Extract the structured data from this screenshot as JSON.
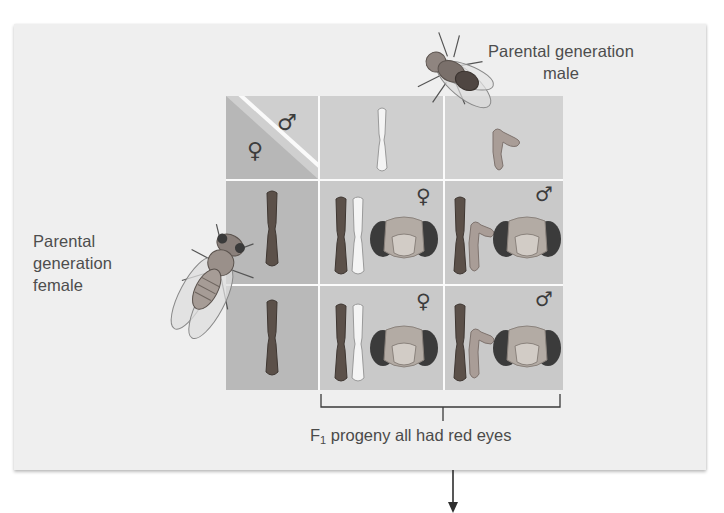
{
  "labels": {
    "parental_female_lines": [
      "Parental",
      "generation",
      "female"
    ],
    "parental_male_lines": [
      "Parental generation",
      "male"
    ],
    "caption_prefix": "F",
    "caption_subscript": "1",
    "caption_text": " progeny all had red eyes"
  },
  "symbols": {
    "female": "♀",
    "male": "♂"
  },
  "punnett_square": {
    "corner": {
      "female_symbol": "♀",
      "male_symbol": "♂"
    },
    "male_gametes": [
      "X (white-eye allele)",
      "Y"
    ],
    "female_gametes": [
      "X (red-eye allele)",
      "X (red-eye allele)"
    ],
    "progeny": [
      {
        "row": 1,
        "col": 1,
        "sex": "♀",
        "chromosomes": "X X",
        "eye_color": "red"
      },
      {
        "row": 1,
        "col": 2,
        "sex": "♂",
        "chromosomes": "X Y",
        "eye_color": "red"
      },
      {
        "row": 2,
        "col": 1,
        "sex": "♀",
        "chromosomes": "X X",
        "eye_color": "red"
      },
      {
        "row": 2,
        "col": 2,
        "sex": "♂",
        "chromosomes": "X Y",
        "eye_color": "red"
      }
    ]
  },
  "colors": {
    "card_bg": "#efefef",
    "header_cell": "#cfcfcf",
    "female_gamete_cell": "#b9b9b9",
    "progeny_cell": "#c9c9c9",
    "dark_chromosome": "#5a5048",
    "light_chromosome": "#f2f2f2",
    "y_chromosome": "#a89a94",
    "eye_color": "#3a3a3a"
  }
}
